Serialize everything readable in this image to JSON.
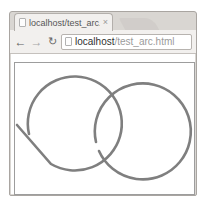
{
  "browser": {
    "tab": {
      "title": "localhost/test_arc.htm",
      "close": "×"
    },
    "nav": {
      "back": "←",
      "forward": "→",
      "reload": "↻"
    },
    "address": {
      "host": "localhost",
      "path": "/test_arc.html"
    }
  },
  "canvas": {
    "shapes": {
      "left": "circle-arc-with-straight-tail",
      "right": "near-closed-circle-arc"
    },
    "stroke_color": "#7f7f7f",
    "border_color": "#9d9d9d"
  }
}
